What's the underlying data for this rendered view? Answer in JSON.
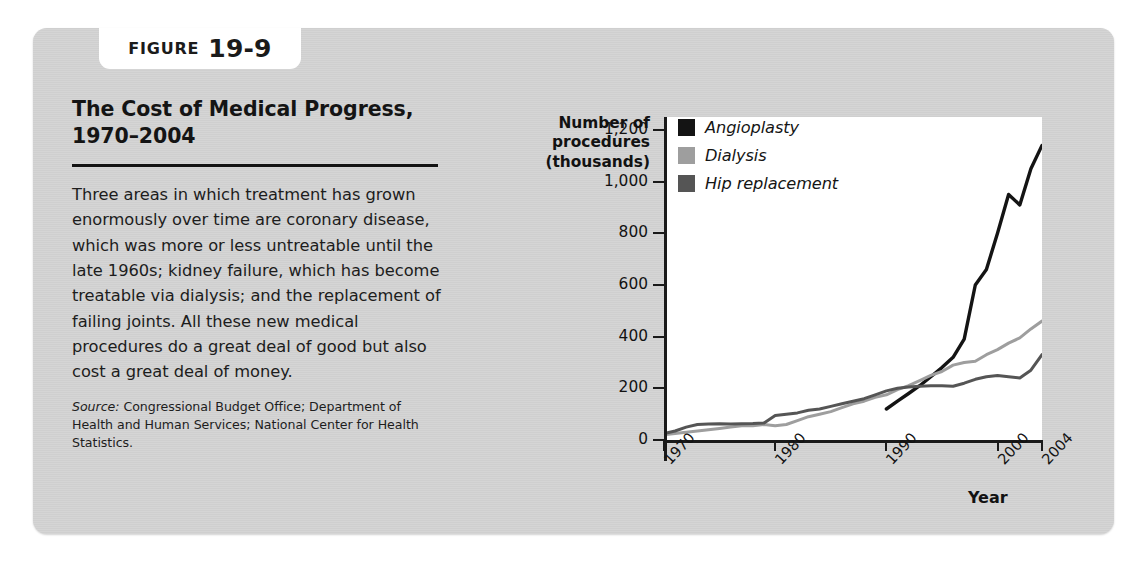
{
  "figure": {
    "tab_word": "FIGURE",
    "tab_number": "19-9",
    "title": "The Cost of Medical Progress, 1970–2004",
    "body": "Three areas in which treatment has grown enormously over time are coronary disease, which was more or less untreatable until the late 1960s; kidney failure, which has become treatable via dialysis; and the replacement of failing joints. All these new medical procedures do a great deal of good but also cost a great deal of money.",
    "source_label": "Source:",
    "source_text": " Congressional Budget Office; Department of Health and Human Services; National Center for Health Statistics."
  },
  "colors": {
    "card_background": "#d3d3d3",
    "plot_background": "#ffffff",
    "angioplasty": "#141414",
    "dialysis": "#9e9e9e",
    "hip_replacement": "#555555",
    "axis": "#1a1a1a"
  },
  "chart_data": {
    "type": "line",
    "title": "The Cost of Medical Progress, 1970–2004",
    "xlabel": "Year",
    "ylabel": "Number of procedures (thousands)",
    "ylim": [
      0,
      1250
    ],
    "xlim": [
      1970,
      2004
    ],
    "yticks": [
      0,
      200,
      400,
      600,
      800,
      1000,
      1200
    ],
    "ytick_labels": [
      "0",
      "200",
      "400",
      "600",
      "800",
      "1,000",
      "1,200"
    ],
    "xticks": [
      1970,
      1980,
      1990,
      2000,
      2004
    ],
    "xtick_labels": [
      "1970",
      "1980",
      "1990",
      "2000",
      "2004"
    ],
    "grid": false,
    "legend_position": "top-left-inside",
    "x": [
      1970,
      1971,
      1972,
      1973,
      1974,
      1975,
      1976,
      1977,
      1978,
      1979,
      1980,
      1981,
      1982,
      1983,
      1984,
      1985,
      1986,
      1987,
      1988,
      1989,
      1990,
      1991,
      1992,
      1993,
      1994,
      1995,
      1996,
      1997,
      1998,
      1999,
      2000,
      2001,
      2002,
      2003,
      2004
    ],
    "series": [
      {
        "name": "Angioplasty",
        "color": "#141414",
        "values": [
          0,
          0,
          0,
          0,
          0,
          0,
          0,
          0,
          0,
          0,
          0,
          0,
          0,
          0,
          0,
          0,
          0,
          0,
          0,
          0,
          120,
          150,
          180,
          210,
          245,
          280,
          320,
          390,
          600,
          660,
          800,
          950,
          910,
          1050,
          1140
        ]
      },
      {
        "name": "Dialysis",
        "color": "#9e9e9e",
        "values": [
          20,
          25,
          30,
          35,
          40,
          45,
          50,
          55,
          55,
          60,
          55,
          60,
          75,
          90,
          100,
          110,
          125,
          140,
          150,
          165,
          175,
          195,
          210,
          230,
          250,
          265,
          290,
          300,
          305,
          330,
          350,
          375,
          395,
          430,
          460
        ]
      },
      {
        "name": "Hip replacement",
        "color": "#555555",
        "values": [
          25,
          35,
          50,
          60,
          62,
          63,
          62,
          63,
          64,
          66,
          95,
          100,
          105,
          115,
          120,
          130,
          140,
          150,
          160,
          175,
          190,
          200,
          205,
          208,
          210,
          210,
          208,
          220,
          235,
          245,
          250,
          245,
          240,
          270,
          330
        ]
      }
    ]
  }
}
